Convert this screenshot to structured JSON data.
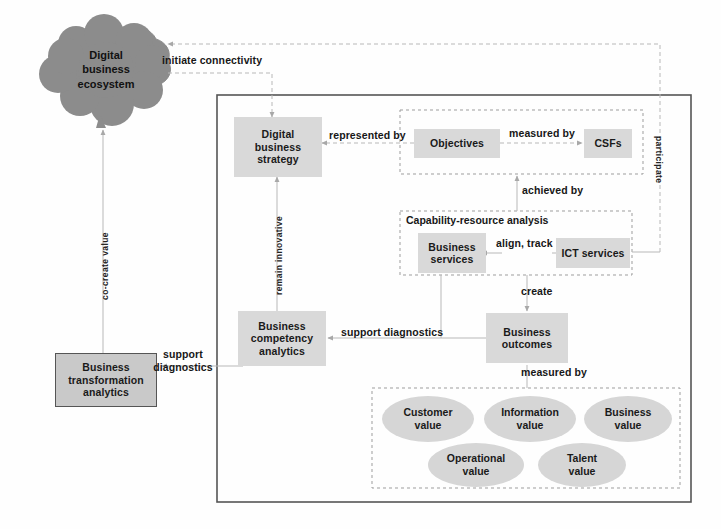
{
  "diagram": {
    "colors": {
      "node_fill": "#d9d9d9",
      "cloud_fill": "#8c8c8c",
      "ellipse_fill": "#d6d6d6",
      "line": "#b0b0b0",
      "border": "#555555"
    },
    "cloud": {
      "label": "Digital\nbusiness\necosystem",
      "name": "digital-business-ecosystem"
    },
    "nodes": {
      "digital_business_strategy": "Digital\nbusiness\nstrategy",
      "objectives": "Objectives",
      "csfs": "CSFs",
      "business_services": "Business\nservices",
      "ict_services": "ICT services",
      "business_competency_analytics": "Business\ncompetency\nanalytics",
      "business_outcomes": "Business\noutcomes",
      "business_transformation_analytics": "Business\ntransformation\nanalytics"
    },
    "groups": {
      "capability_resource_analysis": "Capability-resource analysis"
    },
    "value_ellipses": [
      {
        "label": "Customer\nvalue",
        "name": "customer-value"
      },
      {
        "label": "Information\nvalue",
        "name": "information-value"
      },
      {
        "label": "Business\nvalue",
        "name": "business-value"
      },
      {
        "label": "Operational\nvalue",
        "name": "operational-value"
      },
      {
        "label": "Talent\nvalue",
        "name": "talent-value"
      }
    ],
    "edge_labels": {
      "initiate_connectivity": "initiate  connectivity",
      "represented_by": "represented by",
      "measured_by_csf": "measured by",
      "achieved_by": "achieved by",
      "align_track": "align, track",
      "create": "create",
      "support_diagnostics_left": "support\ndiagnostics",
      "support_diagnostics_mid": "support diagnostics",
      "measured_by_outcomes": "measured by",
      "co_create_value": "co-create value",
      "remain_innovative": "remain innovative",
      "participate": "participate"
    }
  }
}
